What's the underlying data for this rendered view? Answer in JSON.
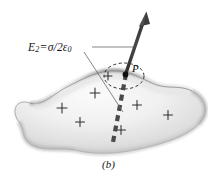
{
  "figure": {
    "caption": "(b)",
    "labels": {
      "field_symbol": "E",
      "field_subscript": "2",
      "equals": "=",
      "field_expression_numerator": "σ",
      "field_expression_slash": "/",
      "field_expression_denominator": "2ε",
      "field_expression_denominator_sub": "0",
      "point": "P"
    },
    "colors": {
      "arrow": "#3b3b3b",
      "dashed_line": "#4a4a4a",
      "gaussian_surface": "#2b2b2b",
      "leader_line": "#6e6e6e",
      "charge_marks": "#2e2e2e",
      "conductor_fill_light": "#f4f4f4",
      "conductor_fill_mid": "#d9d9d9",
      "conductor_edge": "#8e8e8e",
      "text": "#121212",
      "background": "#ffffff"
    },
    "elements": {
      "conductor_name": "charged irregular conductor blob",
      "arrow_name": "electric-field-vector-arrow",
      "gaussian_name": "dashed-gaussian-circle",
      "axis_name": "thick-dashed-symmetry-line",
      "point_name": "point-P-marker"
    },
    "charge_marks": [
      {
        "x": 62,
        "y": 108,
        "size": 5.0
      },
      {
        "x": 95,
        "y": 93,
        "size": 5.0
      },
      {
        "x": 80,
        "y": 122,
        "size": 4.6
      },
      {
        "x": 137,
        "y": 105,
        "size": 4.6
      },
      {
        "x": 121,
        "y": 130,
        "size": 4.6
      },
      {
        "x": 168,
        "y": 115,
        "size": 4.6
      },
      {
        "x": 108,
        "y": 76,
        "size": 4.2
      }
    ],
    "geometry": {
      "point_P": {
        "x": 125.5,
        "y": 73.5
      },
      "arrow_tip": {
        "x": 146,
        "y": 12
      },
      "gaussian_center": {
        "x": 124,
        "y": 76
      },
      "gaussian_radius_x": 20,
      "gaussian_radius_y": 13,
      "leader_horizontal_y": 47,
      "leader_horizontal_x1": 92,
      "leader_horizontal_x2": 132,
      "diagonal_leader_from": {
        "x": 83,
        "y": 52
      },
      "diagonal_leader_to": {
        "x": 123,
        "y": 112
      }
    }
  }
}
